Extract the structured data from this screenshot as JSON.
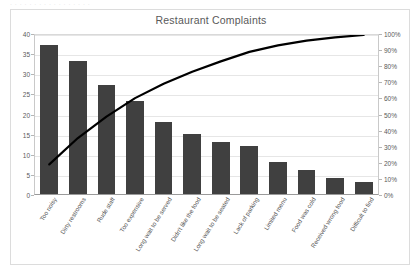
{
  "page": {
    "top_fragment": "· · · · · · · · · · · · · · · · ·"
  },
  "chart_data": {
    "type": "bar",
    "title": "Restaurant Complaints",
    "xlabel": "",
    "ylabel": "",
    "grid": true,
    "legend": "none",
    "categories": [
      "Too noisy",
      "Dirty restrooms",
      "Rude staff",
      "Too expensive",
      "Long wait to be served",
      "Didn't like the food",
      "Long wait to be seated",
      "Lack of parking",
      "Limited menu",
      "Food was cold",
      "Received wrong food",
      "Difficult to find"
    ],
    "values": [
      37,
      33,
      27,
      23,
      18,
      15,
      13,
      12,
      8,
      6,
      4,
      3
    ],
    "total": 199,
    "cumulative_percent": [
      18.6,
      35.2,
      48.7,
      60.3,
      69.3,
      76.9,
      83.4,
      89.4,
      93.5,
      96.5,
      98.5,
      100.0
    ],
    "ylim": [
      0,
      40
    ],
    "y2lim": [
      0,
      100
    ],
    "yticks": [
      "0",
      "5",
      "10",
      "15",
      "20",
      "25",
      "30",
      "35",
      "40"
    ],
    "ytick_values": [
      0,
      5,
      10,
      15,
      20,
      25,
      30,
      35,
      40
    ],
    "y2ticks": [
      "0%",
      "10%",
      "20%",
      "30%",
      "40%",
      "50%",
      "60%",
      "70%",
      "80%",
      "90%",
      "100%"
    ],
    "y2tick_values": [
      0,
      10,
      20,
      30,
      40,
      50,
      60,
      70,
      80,
      90,
      100
    ],
    "series": [
      {
        "name": "Complaint count",
        "type": "bar",
        "axis": "left",
        "values": [
          37,
          33,
          27,
          23,
          18,
          15,
          13,
          12,
          8,
          6,
          4,
          3
        ]
      },
      {
        "name": "Cumulative percentage",
        "type": "line",
        "axis": "right",
        "values": [
          18.6,
          35.2,
          48.7,
          60.3,
          69.3,
          76.9,
          83.4,
          89.4,
          93.5,
          96.5,
          98.5,
          100.0
        ]
      }
    ]
  },
  "colors": {
    "bar": "#404040",
    "line": "#000000",
    "grid": "#e6e6e6",
    "axis_text": "#5a5a5a",
    "title_text": "#595959",
    "frame": "#dcdcdc",
    "background": "#ffffff"
  }
}
